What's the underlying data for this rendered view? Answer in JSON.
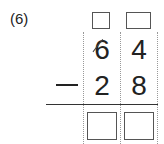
{
  "problem": {
    "number_label": "(6)",
    "minuend": {
      "tens": "6",
      "ones": "4"
    },
    "operator": "−",
    "subtrahend": {
      "tens": "2",
      "ones": "8"
    },
    "borrow_boxes": [
      "",
      ""
    ],
    "answer_boxes": [
      "",
      ""
    ],
    "tens_crossed_out": true
  }
}
